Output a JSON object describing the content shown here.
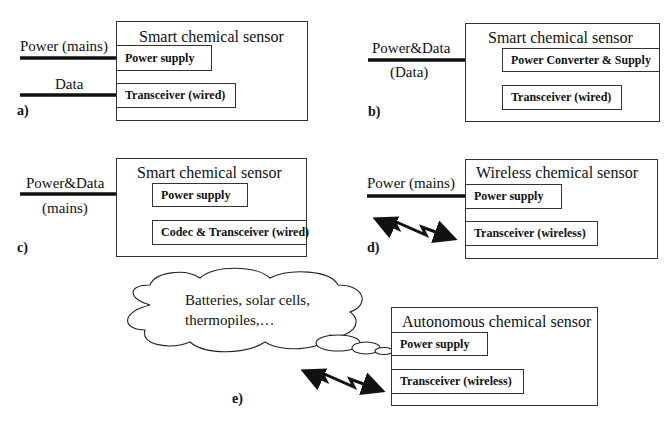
{
  "panels": {
    "a": {
      "letter": "a)",
      "title": "Smart chemical sensor",
      "input_labels": [
        "Power (mains)",
        "Data"
      ],
      "blocks": [
        "Power supply",
        "Transceiver (wired)"
      ]
    },
    "b": {
      "letter": "b)",
      "title": "Smart chemical sensor",
      "input_labels": [
        "Power&Data",
        "(Data)"
      ],
      "blocks": [
        "Power Converter & Supply",
        "Transceiver (wired)"
      ]
    },
    "c": {
      "letter": "c)",
      "title": "Smart chemical sensor",
      "input_labels": [
        "Power&Data",
        "(mains)"
      ],
      "blocks": [
        "Power supply",
        "Codec & Transceiver (wired)"
      ]
    },
    "d": {
      "letter": "d)",
      "title": "Wireless chemical sensor",
      "input_labels": [
        "Power (mains)"
      ],
      "blocks": [
        "Power supply",
        "Transceiver (wireless)"
      ]
    },
    "e": {
      "letter": "e)",
      "title": "Autonomous chemical sensor",
      "cloud_text": [
        "Batteries, solar cells,",
        "thermopiles,…"
      ],
      "blocks": [
        "Power supply",
        "Transceiver (wireless)"
      ]
    }
  },
  "colors": {
    "line": "#111111",
    "border": "#333333",
    "background": "#ffffff"
  }
}
